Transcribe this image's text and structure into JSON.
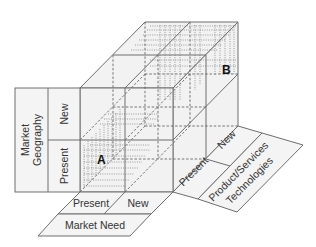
{
  "diagram": {
    "type": "3d-cube-matrix",
    "axes": {
      "vertical": {
        "title": "Market Geography",
        "levels": [
          "New",
          "Present"
        ]
      },
      "horizontal": {
        "title": "Market Need",
        "levels": [
          "Present",
          "New"
        ]
      },
      "depth": {
        "title": "Product/Services Technologies",
        "title_line1": "Product/Services",
        "title_line2": "Technologies",
        "levels": [
          "Present",
          "New"
        ]
      }
    },
    "points": {
      "a": {
        "label": "A",
        "position": "present geography, present need, present technology"
      },
      "b": {
        "label": "B",
        "position": "new geography, new need, new technology"
      }
    },
    "left_panel": {
      "title_line1": "Market",
      "title_line2": "Geography",
      "row_new": "New",
      "row_present": "Present"
    },
    "bottom_panel": {
      "col_present": "Present",
      "col_new": "New",
      "title": "Market Need"
    },
    "right_panel": {
      "col_present": "Present",
      "col_new": "New",
      "title_line1": "Product/Services",
      "title_line2": "Technologies"
    },
    "colors": {
      "face": "#f2f2f2",
      "line": "#6e6e6e",
      "text": "#333333"
    }
  }
}
